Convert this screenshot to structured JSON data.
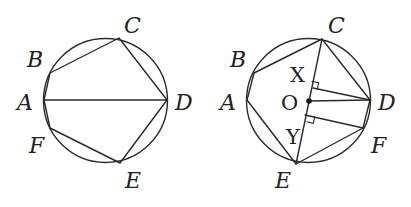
{
  "figures": [
    {
      "id": "left",
      "description": "Hexagon ABCDEF inscribed in circle with diagonal AD",
      "circle": {
        "cx": 105.5,
        "cy": 100.5,
        "r": 62
      },
      "points": {
        "A": [
          44,
          100
        ],
        "B": [
          50,
          73
        ],
        "C": [
          119,
          38
        ],
        "D": [
          167,
          100
        ],
        "E": [
          120,
          163
        ],
        "F": [
          50,
          128
        ]
      },
      "labels": {
        "A": "A",
        "B": "B",
        "C": "C",
        "D": "D",
        "E": "E",
        "F": "F"
      }
    },
    {
      "id": "right",
      "description": "Hexagon ABCDFE inscribed in circle with center O on diagonal CE; perpendiculars DX and FY to CE",
      "circle": {
        "cx": 308.5,
        "cy": 100.5,
        "r": 62
      },
      "points": {
        "A": [
          247,
          100
        ],
        "B": [
          254,
          73
        ],
        "C": [
          322,
          39
        ],
        "D": [
          370,
          100
        ],
        "F": [
          363,
          128
        ],
        "E": [
          296,
          164
        ],
        "O": [
          309,
          101
        ],
        "X": [
          313,
          87
        ],
        "Y": [
          305,
          118
        ]
      },
      "labels": {
        "A": "A",
        "B": "B",
        "C": "C",
        "D": "D",
        "E": "E",
        "F": "F",
        "O": "O",
        "X": "X",
        "Y": "Y"
      }
    }
  ]
}
